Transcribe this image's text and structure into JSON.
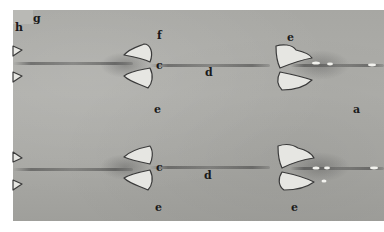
{
  "image": {
    "description": "Photograph of a gel / chromatography plate with two rows of sample wells and migration bands, annotated with letters",
    "background_color": "#a9a9a5",
    "well_color": "#e6e6e2",
    "band_color": "#3c3c3c"
  },
  "labels": {
    "h": "h",
    "g": "g",
    "f": "f",
    "c_top": "c",
    "d_top": "d",
    "e_top_right": "e",
    "e_mid_left": "e",
    "a": "a",
    "c_bottom": "c",
    "d_bottom": "d",
    "e_bottom_left": "e",
    "e_bottom_right": "e"
  }
}
